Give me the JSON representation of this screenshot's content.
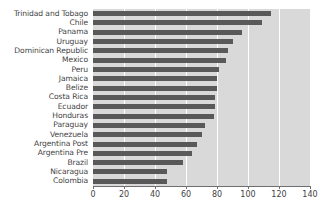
{
  "chart_data": {
    "type": "bar",
    "orientation": "horizontal",
    "title": "",
    "xlabel": "",
    "ylabel": "",
    "xlim": [
      0,
      140
    ],
    "xticks": [
      0,
      20,
      40,
      60,
      80,
      100,
      120,
      140
    ],
    "grid": true,
    "legend": false,
    "bar_color": "#595959",
    "plot_background": "#d9d9d9",
    "categories": [
      "Trinidad and Tobago",
      "Chile",
      "Panama",
      "Uruguay",
      "Dominican Republic",
      "Mexico",
      "Peru",
      "Jamaica",
      "Belize",
      "Costa Rica",
      "Ecuador",
      "Honduras",
      "Paraguay",
      "Venezuela",
      "Argentina Post",
      "Argentina Pre",
      "Brazil",
      "Nicaragua",
      "Colombia"
    ],
    "values": [
      115,
      109,
      96,
      90,
      87,
      86,
      81,
      80,
      80,
      79,
      79,
      78,
      72,
      70,
      67,
      64,
      58,
      48,
      48
    ]
  }
}
